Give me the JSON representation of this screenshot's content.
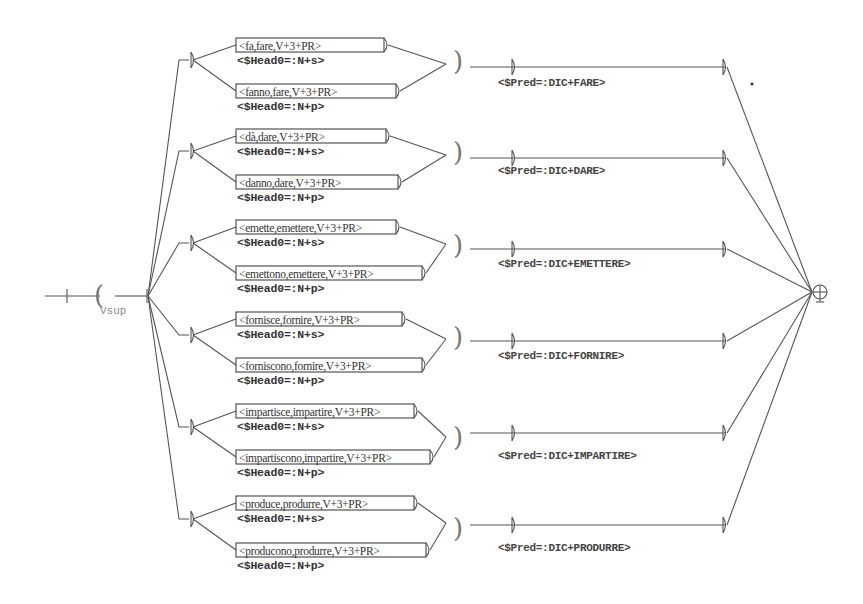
{
  "diagram": {
    "type": "finite-state transducer graph",
    "start_paren": "(",
    "variable_name": "Vsup",
    "final_state_symbol": "⊕",
    "close_paren": ")",
    "groups": [
      {
        "id": "fare",
        "singular": {
          "label": "<fa,fare,V+3+PR>",
          "output": "<$Head0=:N+s>"
        },
        "plural": {
          "label": "<fanno,fare,V+3+PR>",
          "output": "<$Head0=:N+p>"
        },
        "pred": "<$Pred=:DIC+FARE>"
      },
      {
        "id": "dare",
        "singular": {
          "label": "<dà,dare,V+3+PR>",
          "output": "<$Head0=:N+s>"
        },
        "plural": {
          "label": "<danno,dare,V+3+PR>",
          "output": "<$Head0=:N+p>"
        },
        "pred": "<$Pred=:DIC+DARE>"
      },
      {
        "id": "emettere",
        "singular": {
          "label": "<emette,emettere,V+3+PR>",
          "output": "<$Head0=:N+s>"
        },
        "plural": {
          "label": "<emettono,emettere,V+3+PR>",
          "output": "<$Head0=:N+p>"
        },
        "pred": "<$Pred=:DIC+EMETTERE>"
      },
      {
        "id": "fornire",
        "singular": {
          "label": "<fornisce,fornire,V+3+PR>",
          "output": "<$Head0=:N+s>"
        },
        "plural": {
          "label": "<forniscono,fornire,V+3+PR>",
          "output": "<$Head0=:N+p>"
        },
        "pred": "<$Pred=:DIC+FORNIRE>"
      },
      {
        "id": "impartire",
        "singular": {
          "label": "<impartisce,impartire,V+3+PR>",
          "output": "<$Head0=:N+s>"
        },
        "plural": {
          "label": "<impartiscono,impartire,V+3+PR>",
          "output": "<$Head0=:N+p>"
        },
        "pred": "<$Pred=:DIC+IMPARTIRE>"
      },
      {
        "id": "produrre",
        "singular": {
          "label": "<produce,produrre,V+3+PR>",
          "output": "<$Head0=:N+s>"
        },
        "plural": {
          "label": "<producono,produrre,V+3+PR>",
          "output": "<$Head0=:N+p>"
        },
        "pred": "<$Pred=:DIC+PRODURRE>"
      }
    ]
  },
  "colors": {
    "line": "#555555",
    "text": "#333333",
    "muted": "#888888",
    "background": "#ffffff"
  }
}
